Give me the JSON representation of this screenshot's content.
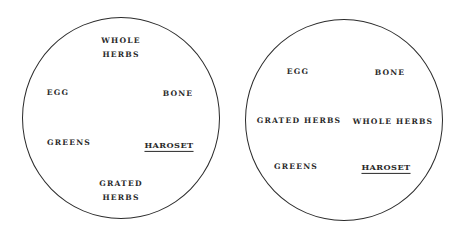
{
  "diagram": {
    "type": "seder-plate-arrangements",
    "plates": [
      {
        "id": "left",
        "labels": {
          "whole_herbs_line1": "WHOLE",
          "whole_herbs_line2": "HERBS",
          "egg": "EGG",
          "bone": "BONE",
          "greens": "GREENS",
          "haroset": "HAROSET",
          "grated_herbs_line1": "GRATED",
          "grated_herbs_line2": "HERBS"
        },
        "underlined": [
          "HAROSET"
        ]
      },
      {
        "id": "right",
        "labels": {
          "egg": "EGG",
          "bone": "BONE",
          "grated_herbs": "GRATED HERBS",
          "whole_herbs": "WHOLE HERBS",
          "greens": "GREENS",
          "haroset": "HAROSET"
        },
        "underlined": [
          "HAROSET"
        ]
      }
    ],
    "colors": {
      "line": "#2b2b2b",
      "text": "#2a2a2a",
      "background": "#ffffff"
    }
  }
}
